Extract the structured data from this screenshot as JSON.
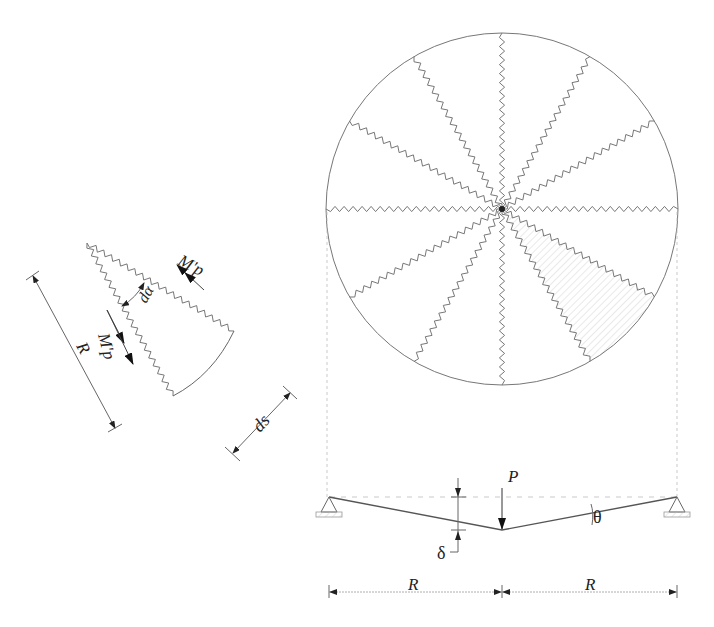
{
  "figure": {
    "plate": {
      "radial_yield_lines": 12,
      "shaded_sector_index": 1,
      "colors": {
        "outline": "#777777",
        "yield_line": "#777777",
        "hatch": "#cccccc"
      }
    },
    "element": {
      "labels": {
        "moment_top": "M'p",
        "moment_side": "M'p",
        "angle": "dα",
        "radius": "R",
        "arc_length": "ds"
      }
    },
    "section": {
      "labels": {
        "load": "P",
        "deflection": "δ",
        "rotation": "θ",
        "span_left": "R",
        "span_right": "R"
      }
    }
  }
}
